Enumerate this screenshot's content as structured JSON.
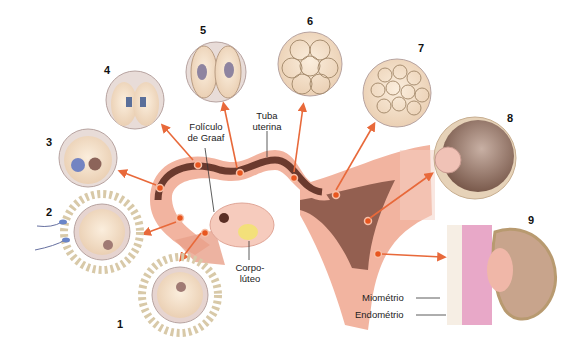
{
  "diagram": {
    "stages": [
      {
        "number": "1",
        "name": "oócito com coroa radiada"
      },
      {
        "number": "2",
        "name": "fecundação"
      },
      {
        "number": "3",
        "name": "zigoto"
      },
      {
        "number": "4",
        "name": "primeira divisão"
      },
      {
        "number": "5",
        "name": "2 células"
      },
      {
        "number": "6",
        "name": "mórula inicial"
      },
      {
        "number": "7",
        "name": "mórula"
      },
      {
        "number": "8",
        "name": "blastocisto"
      },
      {
        "number": "9",
        "name": "implantação"
      }
    ],
    "labels": {
      "foliculo_line1": "Folículo",
      "foliculo_line2": "de Graaf",
      "tuba_line1": "Tuba",
      "tuba_line2": "uterina",
      "corpo_line1": "Corpo-",
      "corpo_line2": "lúteo",
      "miometrio": "Miométrio",
      "endometrio": "Endométrio"
    },
    "colors": {
      "arrow": "#e8693a",
      "tissue": "#f2b4a0",
      "lumen": "#6b3a2e",
      "cell": "#f3dcc4",
      "dot": "#e8561f"
    }
  }
}
